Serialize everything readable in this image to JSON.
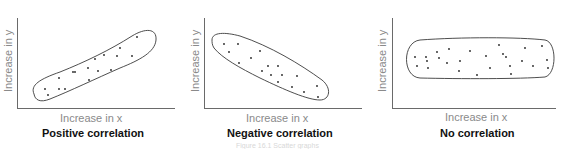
{
  "chart_data": [
    {
      "type": "scatter",
      "title": "Positive correlation",
      "xlabel": "Increase in x",
      "ylabel": "Increase in y",
      "grid": false,
      "legend": null,
      "annotation": "ellipse enclosing points, rising left-to-right",
      "points": [
        [
          45,
          89
        ],
        [
          48,
          95
        ],
        [
          59,
          78
        ],
        [
          59,
          89
        ],
        [
          65,
          89
        ],
        [
          73,
          72
        ],
        [
          75,
          72
        ],
        [
          88,
          68
        ],
        [
          89,
          80
        ],
        [
          95,
          59
        ],
        [
          98,
          71
        ],
        [
          104,
          55
        ],
        [
          111,
          70
        ],
        [
          117,
          56
        ],
        [
          120,
          48
        ],
        [
          132,
          56
        ],
        [
          137,
          37
        ]
      ]
    },
    {
      "type": "scatter",
      "title": "Negative correlation",
      "xlabel": "Increase in x",
      "ylabel": "Increase in y",
      "grid": false,
      "legend": null,
      "annotation": "ellipse enclosing points, falling left-to-right",
      "points": [
        [
          224,
          44
        ],
        [
          238,
          44
        ],
        [
          229,
          52
        ],
        [
          260,
          51
        ],
        [
          251,
          58
        ],
        [
          239,
          63
        ],
        [
          268,
          66
        ],
        [
          278,
          66
        ],
        [
          262,
          71
        ],
        [
          271,
          75
        ],
        [
          282,
          75
        ],
        [
          297,
          76
        ],
        [
          278,
          82
        ],
        [
          292,
          87
        ],
        [
          317,
          86
        ],
        [
          304,
          92
        ],
        [
          318,
          97
        ]
      ]
    },
    {
      "type": "scatter",
      "title": "No correlation",
      "xlabel": "Increase in x",
      "ylabel": "Increase in y",
      "grid": false,
      "legend": null,
      "annotation": "horizontal ellipse enclosing scattered points",
      "points": [
        [
          415,
          57
        ],
        [
          417,
          66
        ],
        [
          426,
          57
        ],
        [
          427,
          61
        ],
        [
          428,
          68
        ],
        [
          437,
          52
        ],
        [
          439,
          58
        ],
        [
          447,
          63
        ],
        [
          449,
          49
        ],
        [
          460,
          61
        ],
        [
          459,
          71
        ],
        [
          470,
          51
        ],
        [
          477,
          75
        ],
        [
          486,
          56
        ],
        [
          490,
          68
        ],
        [
          499,
          45
        ],
        [
          503,
          54
        ],
        [
          506,
          57
        ],
        [
          510,
          66
        ],
        [
          511,
          74
        ],
        [
          522,
          61
        ],
        [
          525,
          48
        ],
        [
          533,
          66
        ],
        [
          542,
          46
        ],
        [
          547,
          60
        ],
        [
          548,
          68
        ]
      ]
    }
  ],
  "charts": [
    {
      "title": "Positive correlation",
      "xlabel": "Increase in x",
      "ylabel": "Increase in y"
    },
    {
      "title": "Negative correlation",
      "xlabel": "Increase in x",
      "ylabel": "Increase in y"
    },
    {
      "title": "No correlation",
      "xlabel": "Increase in x",
      "ylabel": "Increase in y"
    }
  ],
  "caption": "Figure 16.1 Scatter graphs"
}
